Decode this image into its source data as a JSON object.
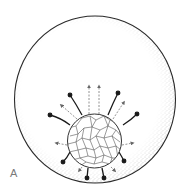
{
  "figure": {
    "panel_label": "A",
    "colors": {
      "outline": "#2a2a2a",
      "stipple": "#555555",
      "cell_lines": "#555555",
      "dashed_arrows": "#777777",
      "processes": "#1a1a1a",
      "label": "#7a7a7a"
    },
    "outer_sphere": {
      "cx": 95,
      "cy": 99.5,
      "rx": 80.5,
      "ry": 83.5
    },
    "inner_mass": {
      "cx": 94.5,
      "cy": 141,
      "r": 27
    },
    "solid_processes": [
      {
        "x1": 82,
        "y1": 115,
        "x2": 70,
        "y2": 95
      },
      {
        "x1": 108,
        "y1": 115,
        "x2": 118,
        "y2": 93
      },
      {
        "x1": 70,
        "y1": 125,
        "x2": 50,
        "y2": 115
      },
      {
        "x1": 123,
        "y1": 125,
        "x2": 137,
        "y2": 114
      },
      {
        "x1": 70,
        "y1": 152,
        "x2": 63,
        "y2": 162
      },
      {
        "x1": 119,
        "y1": 152,
        "x2": 124,
        "y2": 161
      },
      {
        "x1": 88,
        "y1": 168,
        "x2": 87,
        "y2": 178
      },
      {
        "x1": 102,
        "y1": 168,
        "x2": 104,
        "y2": 178
      }
    ],
    "dashed_arrows": [
      {
        "x1": 89,
        "y1": 114,
        "x2": 89,
        "y2": 85
      },
      {
        "x1": 99,
        "y1": 114,
        "x2": 99,
        "y2": 85
      },
      {
        "x1": 77,
        "y1": 119,
        "x2": 60,
        "y2": 104
      },
      {
        "x1": 113,
        "y1": 119,
        "x2": 125,
        "y2": 101
      },
      {
        "x1": 67,
        "y1": 145,
        "x2": 55,
        "y2": 143
      },
      {
        "x1": 122,
        "y1": 145,
        "x2": 134,
        "y2": 143
      },
      {
        "x1": 82,
        "y1": 167,
        "x2": 78,
        "y2": 172
      },
      {
        "x1": 111,
        "y1": 167,
        "x2": 116,
        "y2": 172
      }
    ]
  }
}
